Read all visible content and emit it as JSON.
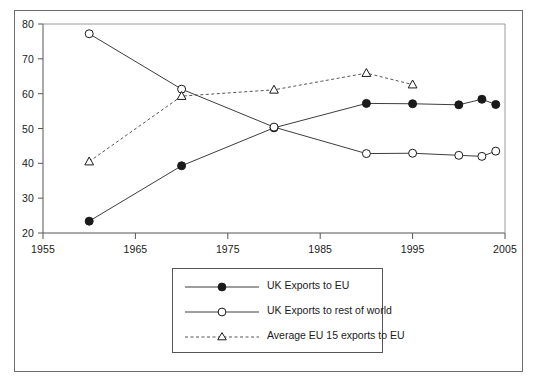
{
  "chart_data": {
    "type": "line",
    "title": "",
    "xlabel": "",
    "ylabel": "",
    "xlim": [
      1955,
      2005
    ],
    "ylim": [
      20,
      80
    ],
    "xticks": [
      1955,
      1965,
      1975,
      1985,
      1995,
      2005
    ],
    "yticks": [
      20,
      30,
      40,
      50,
      60,
      70,
      80
    ],
    "grid": false,
    "legend_position": "below-plot-center",
    "series": [
      {
        "name": "UK Exports to EU",
        "marker": "filled-circle",
        "linestyle": "solid",
        "color": "#3d3d42",
        "x": [
          1960,
          1970,
          1980,
          1990,
          1995,
          2000,
          2002.5,
          2004
        ],
        "values": [
          23.4,
          39.3,
          50.2,
          57.2,
          57.1,
          56.8,
          58.4,
          56.9
        ]
      },
      {
        "name": "UK Exports to rest of world",
        "marker": "open-circle",
        "linestyle": "solid",
        "color": "#3d3d42",
        "x": [
          1960,
          1970,
          1980,
          1990,
          1995,
          2000,
          2002.5,
          2004
        ],
        "values": [
          77.2,
          61.3,
          50.4,
          42.8,
          42.9,
          42.3,
          42.0,
          43.5
        ]
      },
      {
        "name": "Average EU 15 exports to EU",
        "marker": "open-triangle",
        "linestyle": "dashed",
        "color": "#55555a",
        "x": [
          1960,
          1970,
          1980,
          1990,
          1995
        ],
        "values": [
          40.5,
          59.3,
          61.1,
          65.9,
          62.6
        ]
      }
    ]
  },
  "axes": {
    "y_tick_labels": [
      "80",
      "70",
      "60",
      "50",
      "40",
      "30",
      "20"
    ],
    "x_tick_labels": [
      "1955",
      "1965",
      "1975",
      "1985",
      "1995",
      "2005"
    ]
  },
  "legend": {
    "entries": [
      {
        "label": "UK Exports to EU",
        "marker": "filled-circle",
        "linestyle": "solid"
      },
      {
        "label": "UK Exports to rest of world",
        "marker": "open-circle",
        "linestyle": "solid"
      },
      {
        "label": "Average EU 15 exports to EU",
        "marker": "open-triangle",
        "linestyle": "dashed"
      }
    ]
  },
  "colors": {
    "frame": "#6e6e72",
    "axis": "#55555a",
    "series_dark": "#3d3d42",
    "background": "#ffffff"
  }
}
